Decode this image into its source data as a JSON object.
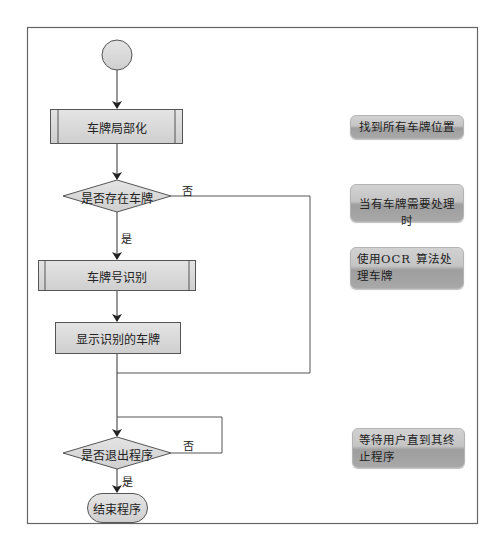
{
  "diagram": {
    "type": "flowchart",
    "nodes": {
      "start": {
        "shape": "circle",
        "label": ""
      },
      "localize": {
        "shape": "predefined-process",
        "label": "车牌局部化"
      },
      "has_plate": {
        "shape": "decision",
        "label": "是否存在车牌"
      },
      "recognize": {
        "shape": "predefined-process",
        "label": "车牌号识别"
      },
      "display": {
        "shape": "process",
        "label": "显示识别的车牌"
      },
      "exit_q": {
        "shape": "decision",
        "label": "是否退出程序"
      },
      "end": {
        "shape": "terminator",
        "label": "结束程序"
      }
    },
    "edge_labels": {
      "has_plate_no": "否",
      "has_plate_yes": "是",
      "exit_no": "否",
      "exit_yes": "是"
    },
    "annotations": [
      "找到所有车牌位置",
      "当有车牌需要处理时",
      "使用OCR 算法处理车牌",
      "等待用户直到其终止程序"
    ],
    "colors": {
      "node_fill": "#d9d9d9",
      "stroke": "#555555",
      "frame": "#666666"
    }
  }
}
